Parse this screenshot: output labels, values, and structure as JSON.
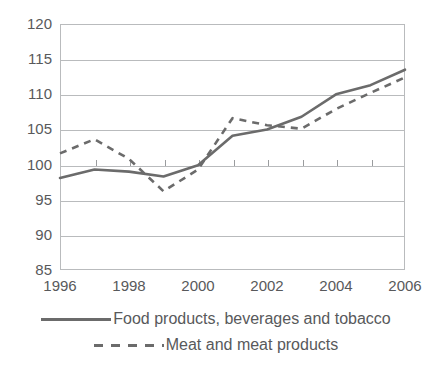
{
  "chart_data": {
    "type": "line",
    "title": "",
    "subtitle": "",
    "xlabel": "",
    "ylabel": "",
    "x": [
      1996,
      1997,
      1998,
      1999,
      2000,
      2001,
      2002,
      2003,
      2004,
      2005,
      2006
    ],
    "xtick_labels": [
      "1996",
      "1998",
      "2000",
      "2002",
      "2004",
      "2006"
    ],
    "xtick_values": [
      1996,
      1998,
      2000,
      2002,
      2004,
      2006
    ],
    "ytick_labels": [
      "120",
      "115",
      "110",
      "105",
      "100",
      "95",
      "90",
      "85"
    ],
    "ytick_values": [
      120,
      115,
      110,
      105,
      100,
      95,
      90,
      85
    ],
    "xlim": [
      1996,
      2006
    ],
    "ylim": [
      85,
      120
    ],
    "grid": "horizontal",
    "legend_position": "bottom",
    "series": [
      {
        "name": "Food products, beverages and tobacco",
        "style": "solid",
        "color": "#6b6b6b",
        "values": [
          98.1,
          99.3,
          99.0,
          98.3,
          99.9,
          104.1,
          105.0,
          106.8,
          110.0,
          111.3,
          113.5
        ]
      },
      {
        "name": "Meat and meat products",
        "style": "dashed",
        "color": "#6b6b6b",
        "values": [
          101.6,
          103.6,
          100.8,
          96.2,
          99.3,
          106.6,
          105.6,
          105.1,
          107.9,
          110.2,
          112.4
        ]
      }
    ]
  },
  "legend": {
    "items": [
      {
        "label": "Food products, beverages and tobacco",
        "style": "solid"
      },
      {
        "label": "Meat and meat products",
        "style": "dashed"
      }
    ]
  },
  "colors": {
    "series_line": "#6b6b6b",
    "gridline": "#b9bbbd",
    "text": "#58595b",
    "background": "#ffffff"
  }
}
